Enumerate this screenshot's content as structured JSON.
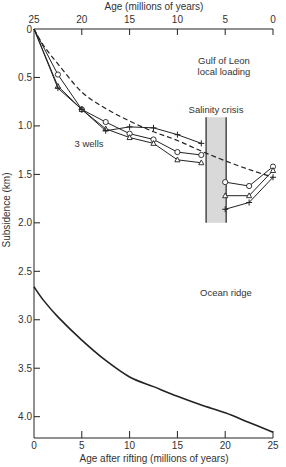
{
  "chart_data": {
    "type": "line",
    "title": "",
    "xlabel": "Age after rifting (millions of years)",
    "x2label": "Age (millions of years)",
    "ylabel": "Subsidence (km)",
    "xlim": [
      0,
      25
    ],
    "ylim": [
      0,
      4.22
    ],
    "y_inverted": true,
    "grid": false,
    "xticks": [
      0,
      5,
      10,
      15,
      20,
      25
    ],
    "xtick_labels": [
      "0",
      "5",
      "10",
      "15",
      "20",
      "25"
    ],
    "x2tick_labels": [
      "25",
      "20",
      "15",
      "10",
      "5",
      "0"
    ],
    "yticks": [
      0,
      0.5,
      1.0,
      1.5,
      2.0,
      2.5,
      3.0,
      3.5,
      4.0
    ],
    "ytick_labels": [
      "0",
      "0.5",
      "1.0",
      "1.5",
      "2.0",
      "2.5",
      "3.0",
      "3.5",
      "4.0"
    ],
    "series": [
      {
        "name": "Well (circles)",
        "marker": "circle",
        "segments": [
          {
            "x": [
              0,
              2.5,
              5,
              7.5,
              10,
              12.5,
              15,
              17.5
            ],
            "y": [
              0,
              0.47,
              0.83,
              0.96,
              1.08,
              1.14,
              1.27,
              1.3
            ]
          },
          {
            "x": [
              20,
              22.5,
              25
            ],
            "y": [
              1.58,
              1.62,
              1.42
            ]
          }
        ]
      },
      {
        "name": "Well (triangles)",
        "marker": "triangle",
        "segments": [
          {
            "x": [
              0,
              2.5,
              5,
              7.5,
              10,
              12.5,
              15,
              17.5
            ],
            "y": [
              0,
              0.59,
              0.83,
              1.03,
              1.12,
              1.18,
              1.35,
              1.38
            ]
          },
          {
            "x": [
              20,
              22.5,
              25
            ],
            "y": [
              1.72,
              1.72,
              1.46
            ]
          }
        ]
      },
      {
        "name": "Well (crosses)",
        "marker": "plus",
        "segments": [
          {
            "x": [
              0,
              2.5,
              5,
              7.5,
              10,
              12.5,
              15,
              17.5
            ],
            "y": [
              0,
              0.61,
              0.83,
              1.05,
              1.01,
              1.02,
              1.09,
              1.18
            ]
          },
          {
            "x": [
              20,
              22.5,
              25
            ],
            "y": [
              1.86,
              1.79,
              1.53
            ]
          }
        ]
      },
      {
        "name": "Gulf of Leon local loading",
        "style": "dashed",
        "x": [
          0,
          1,
          2.5,
          5,
          7.5,
          10,
          12.5,
          15,
          17.5,
          20,
          22.5,
          25
        ],
        "y": [
          0,
          0.17,
          0.36,
          0.65,
          0.82,
          0.95,
          1.06,
          1.15,
          1.26,
          1.36,
          1.45,
          1.53
        ]
      },
      {
        "name": "Ocean ridge",
        "style": "solid",
        "x": [
          0,
          1,
          2.5,
          5,
          7.5,
          10,
          12.5,
          15,
          17.5,
          20,
          22.5,
          25
        ],
        "y": [
          2.66,
          2.8,
          2.97,
          3.21,
          3.42,
          3.59,
          3.69,
          3.79,
          3.88,
          3.96,
          4.06,
          4.16
        ]
      }
    ],
    "bands": [
      {
        "name": "Salinity crisis",
        "x": [
          18.0,
          20.1
        ],
        "y": [
          0.91,
          2.0
        ]
      }
    ],
    "annotations": [
      {
        "text_lines": [
          "Gulf of Leon",
          "local loading"
        ],
        "near": "upper-right"
      },
      {
        "text_lines": [
          "Salinity crisis"
        ],
        "near": "above-band"
      },
      {
        "text_lines": [
          "3 wells"
        ],
        "near": "center-left"
      },
      {
        "text_lines": [
          "Ocean ridge"
        ],
        "near": "middle-right"
      }
    ]
  }
}
